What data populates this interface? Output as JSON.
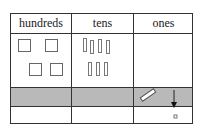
{
  "table": {
    "headers": [
      "hundreds",
      "tens",
      "ones"
    ],
    "rows": [
      {
        "hundreds": {
          "blocks": 4,
          "type": "hundred-flat"
        },
        "tens": {
          "blocks": 7,
          "type": "ten-rod"
        },
        "ones": {
          "blocks": 0
        }
      },
      {
        "shaded": true,
        "hundreds": {
          "blocks": 0
        },
        "tens": {
          "blocks": 0
        },
        "ones": {
          "content": "ten-rod moved with downward arrow"
        }
      },
      {
        "hundreds": {
          "blocks": 0
        },
        "tens": {
          "blocks": 0
        },
        "ones": {
          "blocks": 1,
          "type": "one-cube"
        }
      }
    ],
    "colors": {
      "border": "#333333",
      "shaded_row": "#b9b9b9"
    }
  }
}
